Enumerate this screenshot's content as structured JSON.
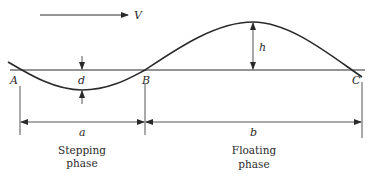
{
  "diagram": {
    "velocity_label": "V",
    "points": {
      "A": "A",
      "B": "B",
      "C": "C"
    },
    "dimensions": {
      "depth": "d",
      "height": "h",
      "stepping_length": "a",
      "floating_length": "b"
    },
    "phases": {
      "stepping": {
        "line1": "Stepping",
        "line2": "phase"
      },
      "floating": {
        "line1": "Floating",
        "line2": "phase"
      }
    },
    "colors": {
      "ink": "#2a2a2a",
      "background": "#ffffff"
    }
  }
}
